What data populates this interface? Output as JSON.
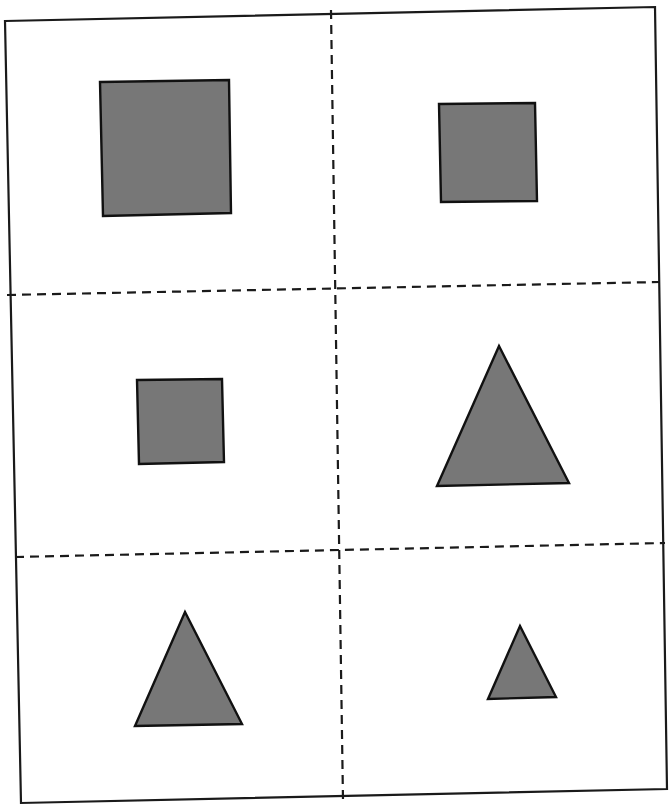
{
  "worksheet": {
    "background": "#ffffff",
    "border_color": "#1a1a1a",
    "shape_fill": "#777777",
    "shape_stroke": "#111111",
    "outer_border": [
      [
        5,
        21
      ],
      [
        655,
        7
      ],
      [
        667,
        789
      ],
      [
        21,
        803
      ]
    ],
    "cut_lines": [
      {
        "name": "vertical-cut-line",
        "from": [
          331,
          10
        ],
        "to": [
          343,
          800
        ]
      },
      {
        "name": "horizontal-cut-line-1",
        "from": [
          7,
          295
        ],
        "to": [
          660,
          282
        ]
      },
      {
        "name": "horizontal-cut-line-2",
        "from": [
          15,
          557
        ],
        "to": [
          665,
          543
        ]
      }
    ],
    "cells": [
      {
        "position": "row1-col1",
        "shape": "square",
        "size": "large",
        "points": [
          [
            100,
            82
          ],
          [
            229,
            80
          ],
          [
            231,
            213
          ],
          [
            103,
            216
          ]
        ]
      },
      {
        "position": "row1-col2",
        "shape": "square",
        "size": "medium",
        "points": [
          [
            439,
            104
          ],
          [
            535,
            103
          ],
          [
            537,
            201
          ],
          [
            441,
            202
          ]
        ]
      },
      {
        "position": "row2-col1",
        "shape": "square",
        "size": "small",
        "points": [
          [
            137,
            380
          ],
          [
            222,
            379
          ],
          [
            224,
            462
          ],
          [
            139,
            464
          ]
        ]
      },
      {
        "position": "row2-col2",
        "shape": "triangle",
        "size": "large",
        "points": [
          [
            499,
            346
          ],
          [
            569,
            483
          ],
          [
            437,
            486
          ]
        ]
      },
      {
        "position": "row3-col1",
        "shape": "triangle",
        "size": "medium",
        "points": [
          [
            185,
            612
          ],
          [
            242,
            724
          ],
          [
            135,
            726
          ]
        ]
      },
      {
        "position": "row3-col2",
        "shape": "triangle",
        "size": "small",
        "points": [
          [
            520,
            626
          ],
          [
            556,
            697
          ],
          [
            488,
            699
          ]
        ]
      }
    ]
  }
}
